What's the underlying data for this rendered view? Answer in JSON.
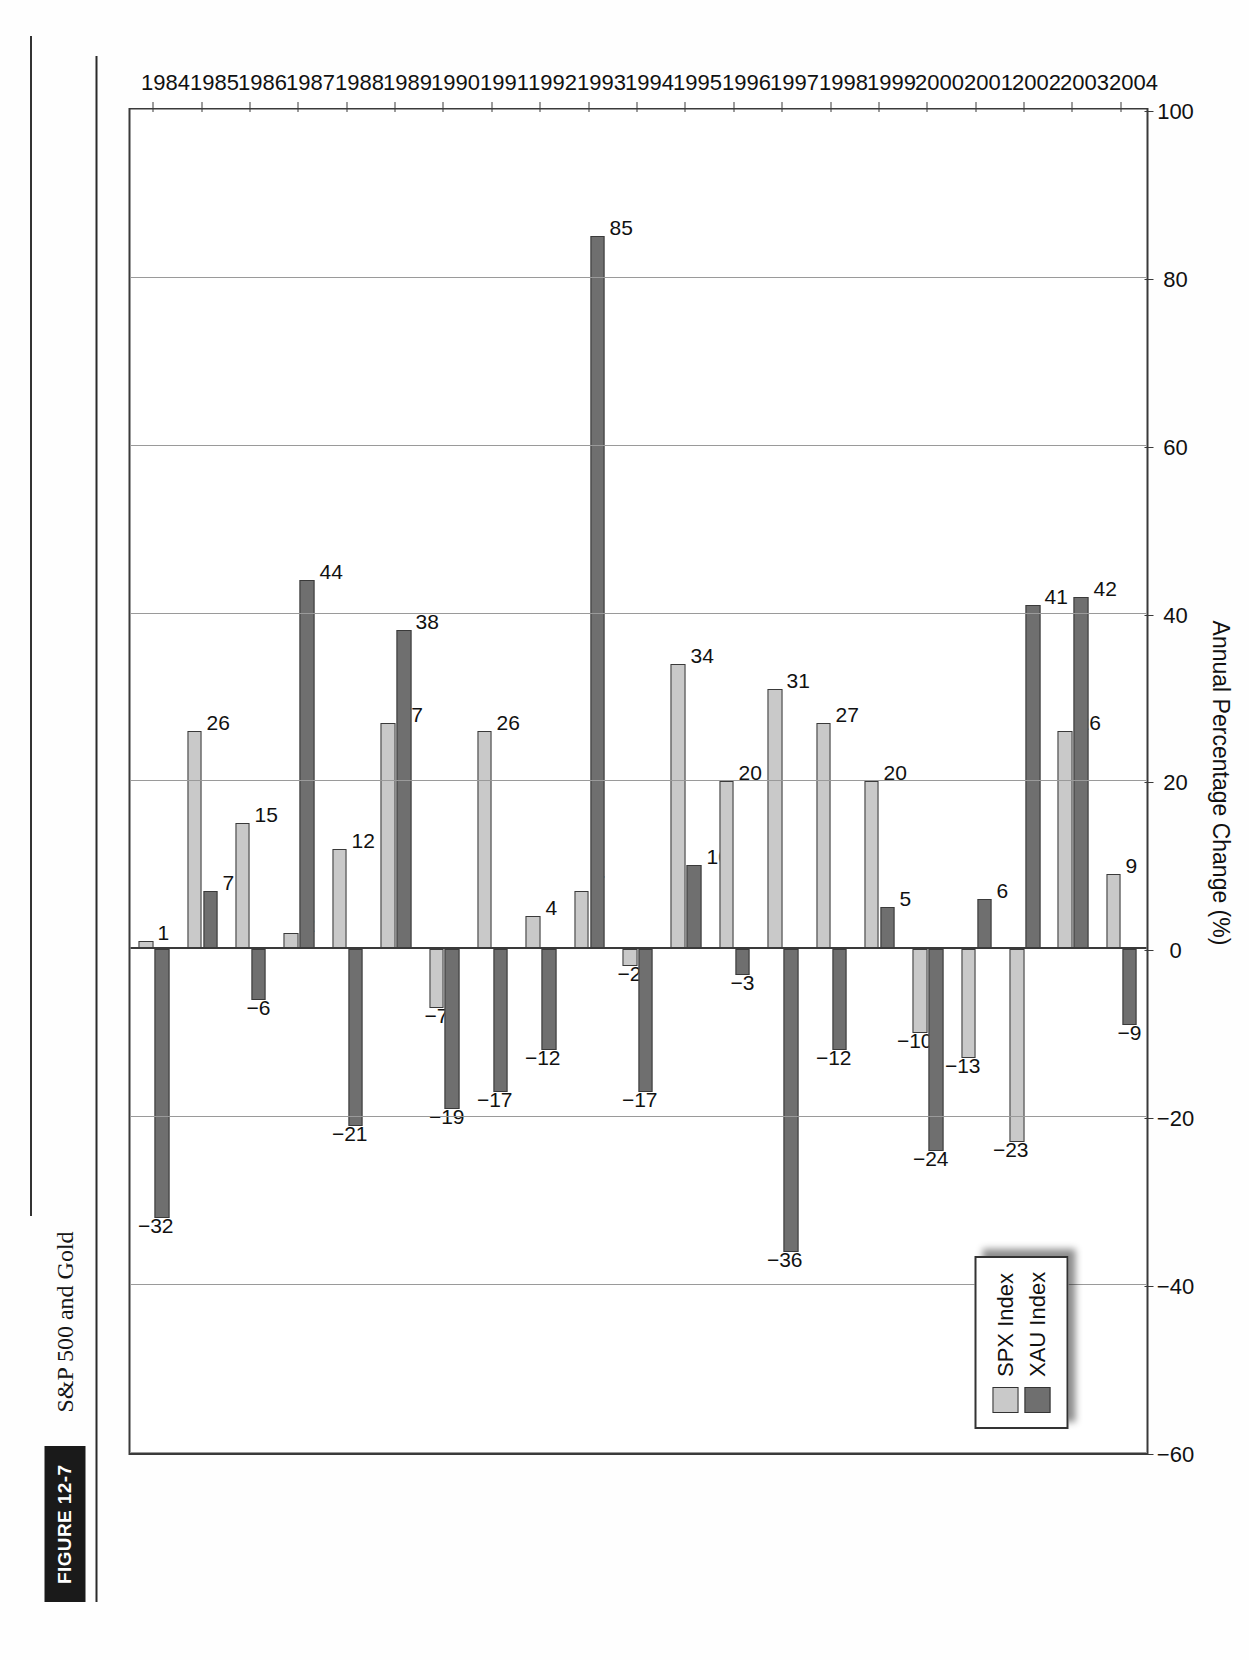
{
  "figure": {
    "badge": "FIGURE 12-7",
    "caption": "S&P 500 and Gold"
  },
  "legend": {
    "position": "inside-left",
    "items": [
      {
        "label": "SPX Index",
        "color": "#c9c9c9",
        "swatch_name": "spx-swatch"
      },
      {
        "label": "XAU Index",
        "color": "#6f6f6f",
        "swatch_name": "xau-swatch"
      }
    ]
  },
  "axes": {
    "value_axis_title": "Annual Percentage Change (%)",
    "value_ticks": [
      "100",
      "80",
      "60",
      "40",
      "20",
      "0",
      "-20",
      "-40",
      "-60"
    ],
    "value_min": -60,
    "value_max": 100,
    "category_ticks": [
      "1984",
      "1985",
      "1986",
      "1987",
      "1988",
      "1989",
      "1990",
      "1991",
      "1992",
      "1993",
      "1994",
      "1995",
      "1996",
      "1997",
      "1998",
      "1999",
      "2000",
      "2001",
      "2002",
      "2003",
      "2004"
    ]
  },
  "chart_data": {
    "type": "bar",
    "title": "S&P 500 and Gold",
    "xlabel": "",
    "ylabel": "Annual Percentage Change (%)",
    "ylim": [
      -60,
      100
    ],
    "grid": true,
    "orientation": "vertical-grouped",
    "legend_position": "upper-left-inside",
    "categories": [
      "1984",
      "1985",
      "1986",
      "1987",
      "1988",
      "1989",
      "1990",
      "1991",
      "1992",
      "1993",
      "1994",
      "1995",
      "1996",
      "1997",
      "1998",
      "1999",
      "2000",
      "2001",
      "2002",
      "2003",
      "2004"
    ],
    "series": [
      {
        "name": "SPX Index",
        "color": "#c9c9c9",
        "values": [
          1,
          26,
          15,
          2,
          12,
          27,
          -7,
          26,
          4,
          7,
          -2,
          34,
          20,
          31,
          27,
          20,
          -10,
          -13,
          -23,
          26,
          9
        ]
      },
      {
        "name": "XAU Index",
        "color": "#6f6f6f",
        "values": [
          -32,
          7,
          -6,
          44,
          -21,
          38,
          -19,
          -17,
          -12,
          85,
          -17,
          10,
          -3,
          -36,
          -12,
          5,
          -24,
          6,
          41,
          42,
          -9
        ]
      }
    ],
    "data_labels": {
      "SPX Index": [
        "1",
        "26",
        "15",
        "2",
        "12",
        "27",
        "-7",
        "26",
        "4",
        "7",
        "-2",
        "34",
        "20",
        "31",
        "27",
        "20",
        "-10",
        "-13",
        "-23",
        "26",
        "9"
      ],
      "XAU Index": [
        "-32",
        "7",
        "-6",
        "44",
        "-21",
        "38",
        "-19",
        "-17",
        "-12",
        "85",
        "-17",
        "10",
        "-3",
        "-36",
        "-12",
        "5",
        "-24",
        "6",
        "41",
        "42",
        "-9"
      ]
    }
  }
}
